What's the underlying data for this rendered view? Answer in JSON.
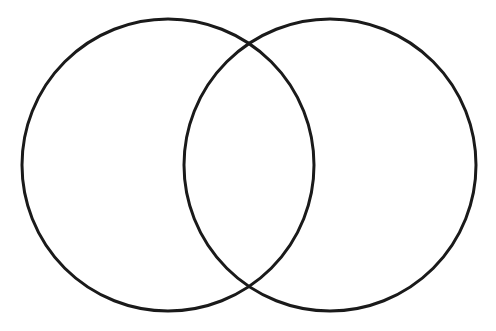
{
  "figure": {
    "type": "venn-diagram",
    "title": "",
    "caption": "",
    "set_count": 2,
    "background_color": "#ffffff",
    "stroke_color": "#1a1a1a",
    "stroke_width": 3,
    "fill": "none",
    "canvas": {
      "width": 496,
      "height": 331
    }
  },
  "chart_data": {
    "type": "venn",
    "title": "",
    "xlabel": "",
    "ylabel": "",
    "sets": [
      {
        "id": "left-set",
        "label": "",
        "value": "",
        "center_x": 168,
        "center_y": 165,
        "radius": 146,
        "stroke": "#1a1a1a",
        "fill": "none"
      },
      {
        "id": "right-set",
        "label": "",
        "value": "",
        "center_x": 330,
        "center_y": 165,
        "radius": 146,
        "stroke": "#1a1a1a",
        "fill": "none"
      }
    ],
    "regions": [
      {
        "id": "left-only",
        "label": "",
        "value": ""
      },
      {
        "id": "intersection",
        "label": "",
        "value": ""
      },
      {
        "id": "right-only",
        "label": "",
        "value": ""
      }
    ],
    "intersection_points": [
      {
        "x": 249,
        "y": 44
      },
      {
        "x": 249,
        "y": 286
      }
    ],
    "legend": [],
    "annotations": []
  }
}
